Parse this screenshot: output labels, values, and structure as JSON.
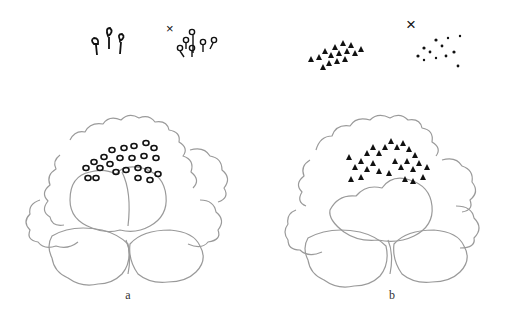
{
  "figure": {
    "panels": [
      {
        "label": "a",
        "description": "Peony line drawing with stamens drawn as small hollow teardrop/ring shapes",
        "examples": {
          "correct_label": "",
          "incorrect_mark": "×"
        }
      },
      {
        "label": "b",
        "description": "Peony line drawing with stamens drawn as solid black dabs",
        "examples": {
          "correct_label": "",
          "incorrect_mark": "×"
        }
      }
    ],
    "colors": {
      "outline": "#9a9a9a",
      "ink": "#111111",
      "background": "#ffffff"
    }
  }
}
